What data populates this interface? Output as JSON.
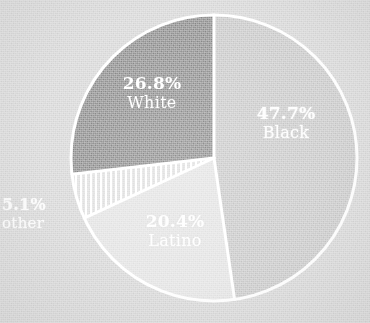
{
  "chart_data": {
    "type": "pie",
    "title": "",
    "subtitle": "",
    "xlabel": "",
    "ylabel": "",
    "legend_position": "in-slice",
    "grid": false,
    "start_angle_deg": 0,
    "direction": "clockwise",
    "center": {
      "x": 214,
      "y": 158
    },
    "radius": 143,
    "categories": [
      "Black",
      "Latino",
      "other",
      "White"
    ],
    "values": [
      47.7,
      20.4,
      5.1,
      26.8
    ],
    "slices": [
      {
        "label": "Black",
        "value": 47.7,
        "display_percent": "47.7%",
        "color": "#c9c9c9",
        "pattern": "solid",
        "start_deg": 0.0,
        "end_deg": 171.72,
        "label_inside": true
      },
      {
        "label": "Latino",
        "value": 20.4,
        "display_percent": "20.4%",
        "color": "#e3e3e3",
        "pattern": "solid",
        "start_deg": 171.72,
        "end_deg": 245.16,
        "label_inside": true
      },
      {
        "label": "other",
        "value": 5.1,
        "display_percent": "5.1%",
        "color": "#dedede",
        "pattern": "vertical-hatch",
        "start_deg": 245.16,
        "end_deg": 263.52,
        "label_inside": false
      },
      {
        "label": "White",
        "value": 26.8,
        "display_percent": "26.8%",
        "color": "#8e8e8e",
        "pattern": "solid",
        "start_deg": 263.52,
        "end_deg": 360.0,
        "label_inside": true
      }
    ]
  },
  "style": {
    "background_color": "#d7d7d7",
    "separator_color": "#ffffff",
    "separator_width": 3,
    "label_text_color": "#ffffff"
  },
  "labels": {
    "black": {
      "percent": "47.7%",
      "category": "Black"
    },
    "white": {
      "percent": "26.8%",
      "category": "White"
    },
    "latino": {
      "percent": "20.4%",
      "category": "Latino"
    },
    "other": {
      "percent": "5.1%",
      "category": "other"
    }
  }
}
